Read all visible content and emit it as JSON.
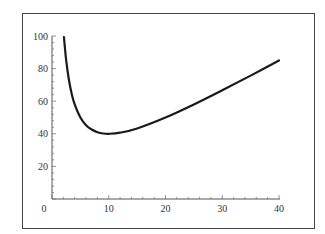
{
  "chart_data": {
    "type": "line",
    "title": "",
    "xlabel": "",
    "ylabel": "",
    "xlim": [
      0,
      40
    ],
    "ylim": [
      0,
      100
    ],
    "grid": false,
    "legend": null,
    "x_ticks": [
      0,
      10,
      20,
      30,
      40
    ],
    "y_ticks": [
      0,
      20,
      40,
      60,
      80,
      100
    ],
    "x_tick_labels": [
      "0",
      "10",
      "20",
      "30",
      "40"
    ],
    "y_tick_labels": [
      "0",
      "20",
      "40",
      "60",
      "80",
      "100"
    ],
    "series": [
      {
        "name": "curve",
        "color": "#1a1a1a",
        "x": [
          2.1,
          2.5,
          3,
          3.5,
          4,
          5,
          6,
          7,
          8,
          9,
          10,
          12,
          15,
          20,
          25,
          30,
          35,
          40
        ],
        "y": [
          99.4,
          85,
          72.7,
          64.1,
          58,
          50,
          45.3,
          42.6,
          41,
          40.2,
          40,
          40.7,
          43.3,
          50,
          58,
          66.7,
          75.7,
          85
        ]
      }
    ]
  }
}
